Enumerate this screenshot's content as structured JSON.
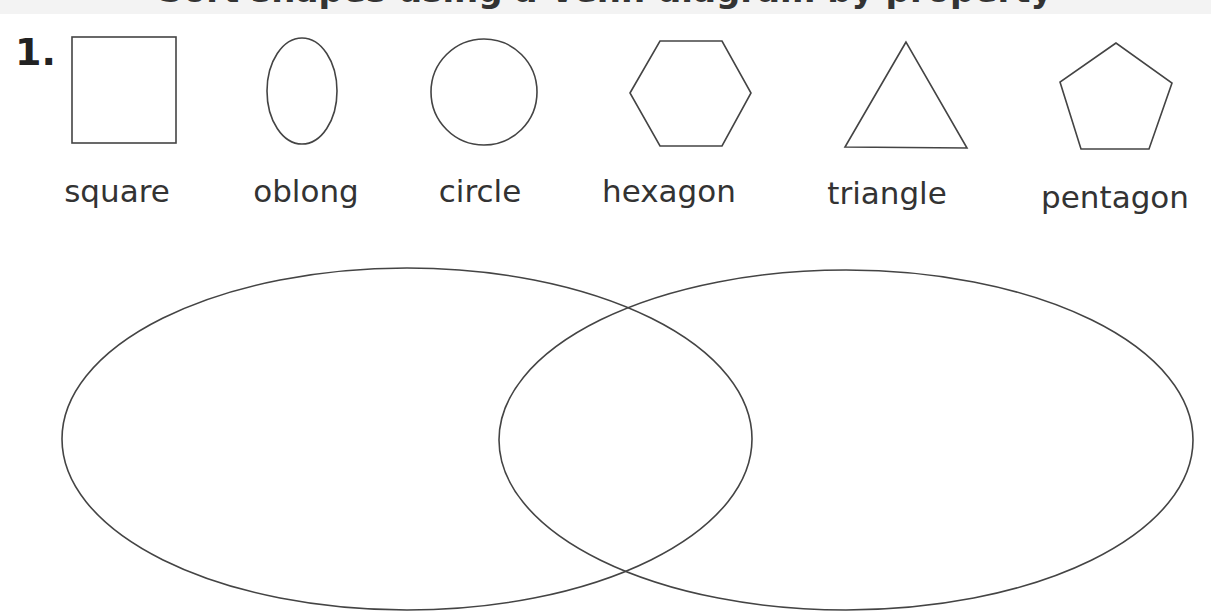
{
  "worksheet": {
    "title_partial": "Sort shapes using a Venn diagram by property",
    "question_number": "1.",
    "stroke_color": "#444444",
    "text_color": "#333333"
  },
  "shapes": [
    {
      "id": "square",
      "label": "square"
    },
    {
      "id": "oblong",
      "label": "oblong"
    },
    {
      "id": "circle",
      "label": "circle"
    },
    {
      "id": "hexagon",
      "label": "hexagon"
    },
    {
      "id": "triangle",
      "label": "triangle"
    },
    {
      "id": "pentagon",
      "label": "pentagon"
    }
  ],
  "venn": {
    "sets": [
      {
        "id": "left-set",
        "label": ""
      },
      {
        "id": "right-set",
        "label": ""
      }
    ]
  }
}
